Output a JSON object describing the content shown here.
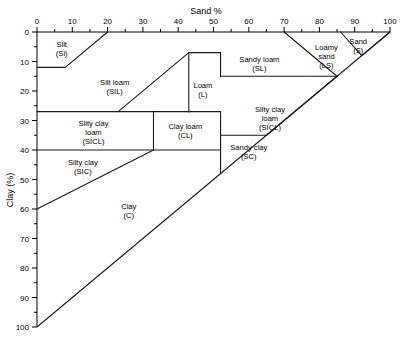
{
  "chart_data": {
    "type": "diagram",
    "xlabel": "Sand %",
    "ylabel": "Clay (%)",
    "xlim": [
      0,
      100
    ],
    "ylim": [
      0,
      100
    ],
    "grid": false,
    "legend": "none",
    "x_ticks": [
      0,
      10,
      20,
      30,
      40,
      50,
      60,
      70,
      80,
      90,
      100
    ],
    "x_tick_labels": [
      "0",
      "10",
      "20",
      "30",
      "40",
      "50",
      "60",
      "70",
      "80",
      "90",
      "100"
    ],
    "x_minor_tick_step": 5,
    "y_ticks": [
      0,
      10,
      20,
      30,
      40,
      50,
      60,
      70,
      80,
      90,
      100
    ],
    "y_tick_labels": [
      "0",
      "10",
      "20",
      "30",
      "40",
      "50",
      "60",
      "70",
      "80",
      "90",
      "100"
    ],
    "y_minor_tick_step": 5,
    "y_axis_direction": "increasing-downward",
    "regions": [
      {
        "id": "silt",
        "name": "Silt",
        "abbrev": "(Si)",
        "label_line1": "Silt",
        "label_line2": "(Si)",
        "label_x": 7,
        "label_y": 5,
        "polygon": [
          [
            0,
            0
          ],
          [
            20,
            0
          ],
          [
            8,
            12
          ],
          [
            0,
            12
          ]
        ]
      },
      {
        "id": "silt-loam",
        "name": "Silt loam",
        "abbrev": "(SiL)",
        "label_line1": "Silt loam",
        "label_line2": "(SIL)",
        "label_x": 22,
        "label_y": 18,
        "polygon": [
          [
            20,
            0
          ],
          [
            50,
            0
          ],
          [
            43,
            7
          ],
          [
            43,
            27
          ],
          [
            23,
            27
          ],
          [
            0,
            27
          ],
          [
            0,
            12
          ],
          [
            8,
            12
          ]
        ]
      },
      {
        "id": "loam",
        "name": "Loam",
        "abbrev": "(L)",
        "label_line1": "Loam",
        "label_line2": "(L)",
        "label_x": 47,
        "label_y": 19,
        "polygon": [
          [
            50,
            0
          ],
          [
            52,
            0
          ],
          [
            52,
            7
          ],
          [
            52,
            27
          ],
          [
            43,
            27
          ],
          [
            23,
            27
          ]
        ]
      },
      {
        "id": "sandy-loam",
        "name": "Sandy loam",
        "abbrev": "(SL)",
        "label_line1": "Sandy loam",
        "label_line2": "(SL)",
        "label_x": 63,
        "label_y": 10,
        "polygon": [
          [
            52,
            0
          ],
          [
            70,
            0
          ],
          [
            85,
            15
          ],
          [
            52,
            15
          ]
        ]
      },
      {
        "id": "loamy-sand",
        "name": "Loamy sand",
        "abbrev": "(LS)",
        "label_line1": "Loamy",
        "label_line2": "sand",
        "label_line3": "(LS)",
        "label_x": 82,
        "label_y": 6,
        "polygon": [
          [
            70,
            0
          ],
          [
            86,
            0
          ],
          [
            92,
            8
          ],
          [
            85,
            15
          ]
        ]
      },
      {
        "id": "sand",
        "name": "Sand",
        "abbrev": "(S)",
        "label_line1": "Sand",
        "label_line2": "(S)",
        "label_x": 91,
        "label_y": 4,
        "polygon": [
          [
            86,
            0
          ],
          [
            100,
            0
          ],
          [
            92,
            8
          ]
        ]
      },
      {
        "id": "silty-clay-loam",
        "name": "Silty clay loam",
        "abbrev": "(SiCL)",
        "label_line1": "Silty clay",
        "label_line2": "loam",
        "label_line3": "(SICL)",
        "label_x": 16,
        "label_y": 32,
        "polygon": [
          [
            0,
            27
          ],
          [
            33,
            27
          ],
          [
            33,
            40
          ],
          [
            0,
            40
          ]
        ]
      },
      {
        "id": "clay-loam",
        "name": "Clay loam",
        "abbrev": "(CL)",
        "label_line1": "Clay loam",
        "label_line2": "(CL)",
        "label_x": 42,
        "label_y": 33,
        "polygon": [
          [
            33,
            27
          ],
          [
            52,
            27
          ],
          [
            52,
            40
          ],
          [
            33,
            40
          ]
        ]
      },
      {
        "id": "silty-clay-loam-right",
        "name": "Silty clay loam",
        "abbrev": "(SiCL)",
        "label_line1": "Silty clay",
        "label_line2": "loam",
        "label_line3": "(SICL)",
        "label_x": 66,
        "label_y": 27,
        "polygon": [
          [
            52,
            15
          ],
          [
            85,
            15
          ],
          [
            65,
            35
          ],
          [
            52,
            35
          ]
        ]
      },
      {
        "id": "sandy-clay",
        "name": "Sandy clay",
        "abbrev": "(SC)",
        "label_line1": "Sandy clay",
        "label_line2": "(SC)",
        "label_x": 60,
        "label_y": 40,
        "polygon": [
          [
            52,
            35
          ],
          [
            65,
            35
          ],
          [
            52,
            48
          ]
        ]
      },
      {
        "id": "silty-clay",
        "name": "Silty clay",
        "abbrev": "(SiC)",
        "label_line1": "Silty clay",
        "label_line2": "(SIC)",
        "label_x": 13,
        "label_y": 45,
        "polygon": [
          [
            0,
            40
          ],
          [
            33,
            40
          ],
          [
            0,
            60
          ]
        ]
      },
      {
        "id": "clay",
        "name": "Clay",
        "abbrev": "(C)",
        "label_line1": "Clay",
        "label_line2": "(C)",
        "label_x": 26,
        "label_y": 60,
        "polygon": [
          [
            0,
            60
          ],
          [
            33,
            40
          ],
          [
            52,
            40
          ],
          [
            52,
            48
          ],
          [
            0,
            100
          ]
        ]
      }
    ],
    "boundary_segments": [
      {
        "name": "silt-diagonal",
        "points": [
          [
            0,
            12
          ],
          [
            8,
            12
          ],
          [
            20,
            0
          ]
        ]
      },
      {
        "name": "silt-loam-right",
        "points": [
          [
            23,
            27
          ],
          [
            43,
            7
          ],
          [
            52,
            7
          ]
        ]
      },
      {
        "name": "loam-step",
        "points": [
          [
            52,
            7
          ],
          [
            52,
            15
          ]
        ]
      },
      {
        "name": "silt-loam-bottom",
        "points": [
          [
            0,
            27
          ],
          [
            43,
            27
          ]
        ]
      },
      {
        "name": "loam-left-vertical",
        "points": [
          [
            43,
            27
          ],
          [
            43,
            7
          ]
        ]
      },
      {
        "name": "loam-bottom",
        "points": [
          [
            43,
            27
          ],
          [
            52,
            27
          ]
        ]
      },
      {
        "name": "clay-loam-vertical",
        "points": [
          [
            33,
            27
          ],
          [
            33,
            40
          ]
        ]
      },
      {
        "name": "sandy-loam-bottom",
        "points": [
          [
            52,
            15
          ],
          [
            85,
            15
          ]
        ]
      },
      {
        "name": "loamy-sand-diagonal",
        "points": [
          [
            70,
            0
          ],
          [
            85,
            15
          ]
        ]
      },
      {
        "name": "sand-diagonal-left",
        "points": [
          [
            86,
            0
          ],
          [
            92,
            8
          ]
        ]
      },
      {
        "name": "sand-diagonal-right",
        "points": [
          [
            100,
            0
          ],
          [
            92,
            8
          ]
        ]
      },
      {
        "name": "sicl-right-diagonal",
        "points": [
          [
            85,
            15
          ],
          [
            65,
            35
          ]
        ]
      },
      {
        "name": "sicl-bottom",
        "points": [
          [
            52,
            35
          ],
          [
            65,
            35
          ]
        ]
      },
      {
        "name": "clay-loam-bottom",
        "points": [
          [
            0,
            40
          ],
          [
            52,
            40
          ]
        ]
      },
      {
        "name": "sandy-clay-vertical",
        "points": [
          [
            52,
            27
          ],
          [
            52,
            48
          ]
        ]
      },
      {
        "name": "silty-clay-diagonal",
        "points": [
          [
            0,
            60
          ],
          [
            33,
            40
          ]
        ]
      },
      {
        "name": "hypotenuse",
        "points": [
          [
            0,
            100
          ],
          [
            100,
            0
          ]
        ]
      }
    ]
  },
  "axes": {
    "top_title": "Sand %",
    "left_title": "Clay (%)"
  }
}
